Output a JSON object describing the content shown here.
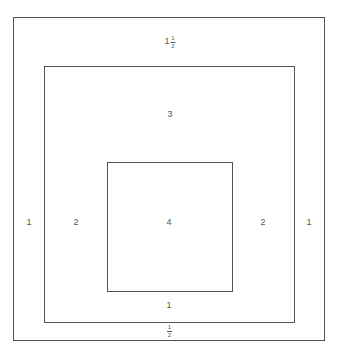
{
  "diagram": {
    "type": "nested-squares",
    "boxes": [
      {
        "name": "outer",
        "left": 13,
        "top": 17,
        "right": 324,
        "bottom": 340
      },
      {
        "name": "middle",
        "left": 44,
        "top": 66,
        "right": 294,
        "bottom": 322
      },
      {
        "name": "inner",
        "left": 107,
        "top": 162,
        "right": 232,
        "bottom": 291
      }
    ],
    "labels": {
      "top_outer": {
        "whole": "1",
        "num": "1",
        "den": "2"
      },
      "middle_top": "3",
      "left_outer": "1",
      "left_middle": "2",
      "center": "4",
      "right_middle": "2",
      "right_outer": "1",
      "bottom_inner": "1",
      "bottom_outer": {
        "num": "1",
        "den": "2"
      }
    }
  }
}
